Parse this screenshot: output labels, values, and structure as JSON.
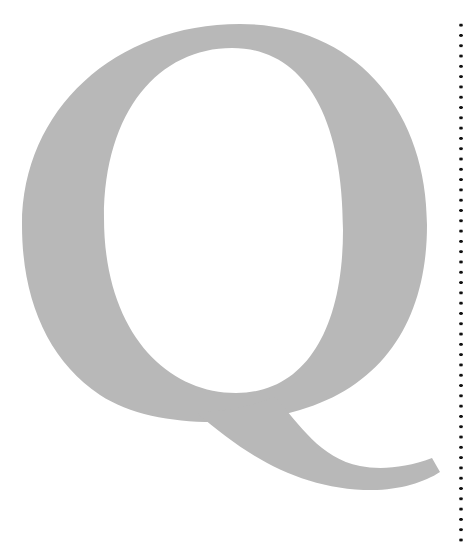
{
  "glyph": {
    "character": "Q",
    "color": "#b8b8b8"
  },
  "divider": {
    "style": "dotted",
    "color": "#111111"
  }
}
